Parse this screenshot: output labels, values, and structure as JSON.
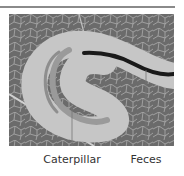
{
  "figure": {
    "labels": {
      "caterpillar": "Caterpillar",
      "feces": "Feces"
    },
    "colors": {
      "leaf": "#6b6b6b",
      "vein": "#c9c9c9",
      "mine": "#c6c6c6",
      "caterpillar": "#9a9a9a",
      "feces": "#1a1a1a",
      "leader": "#777777",
      "rule": "#8a8a8a"
    }
  }
}
